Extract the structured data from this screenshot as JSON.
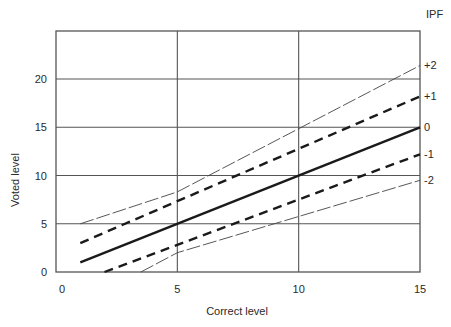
{
  "chart_data": {
    "type": "line",
    "title": "",
    "xlabel": "Correct level",
    "ylabel": "Voted level",
    "xlim": [
      0,
      15
    ],
    "ylim": [
      0,
      25
    ],
    "xticks": [
      0,
      5,
      10,
      15
    ],
    "yticks": [
      0,
      5,
      10,
      15,
      20
    ],
    "grid": true,
    "legend_title": "IPF",
    "legend_position": "right (labels at line ends)",
    "series": [
      {
        "name": "+2",
        "style": "thin-dashed",
        "points": [
          [
            1,
            5
          ],
          [
            5,
            8.3
          ],
          [
            15,
            21.4
          ]
        ]
      },
      {
        "name": "+1",
        "style": "thick-dashed",
        "points": [
          [
            1,
            3
          ],
          [
            15,
            18.2
          ]
        ]
      },
      {
        "name": "0",
        "style": "solid",
        "points": [
          [
            1,
            1
          ],
          [
            15,
            15
          ]
        ]
      },
      {
        "name": "-1",
        "style": "thick-dashed",
        "points": [
          [
            2,
            0
          ],
          [
            15,
            12.2
          ]
        ]
      },
      {
        "name": "-2",
        "style": "thin-dashed",
        "points": [
          [
            3.5,
            0
          ],
          [
            5,
            2
          ],
          [
            15,
            9.5
          ]
        ]
      }
    ]
  },
  "labels": {
    "xlabel": "Correct level",
    "ylabel": "Voted level",
    "legend_title": "IPF"
  }
}
